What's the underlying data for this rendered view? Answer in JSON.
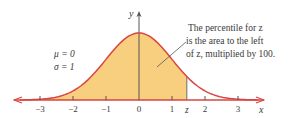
{
  "diagram": {
    "type": "normal-distribution",
    "params": {
      "mu_label": "μ = 0",
      "sigma_label": "σ = 1"
    },
    "annotation": {
      "line1": "The percentile for z",
      "line2": "is the area to the left",
      "line3": "of z, multiplied by 100."
    },
    "axes": {
      "x_label": "x",
      "y_label": "y",
      "ticks": [
        {
          "value": -3,
          "label": "−3"
        },
        {
          "value": -2,
          "label": "−2"
        },
        {
          "value": -1,
          "label": "−1"
        },
        {
          "value": 0,
          "label": "0"
        },
        {
          "value": 1,
          "label": "1"
        },
        {
          "value": 2,
          "label": "2"
        },
        {
          "value": 3,
          "label": "3"
        }
      ],
      "z_label": "z",
      "z_value": 1.45
    },
    "colors": {
      "curve": "#d9453f",
      "fill": "#f8cf7f",
      "axis": "#555555",
      "text": "#3a3a3a",
      "arrow": "#d9453f"
    }
  }
}
